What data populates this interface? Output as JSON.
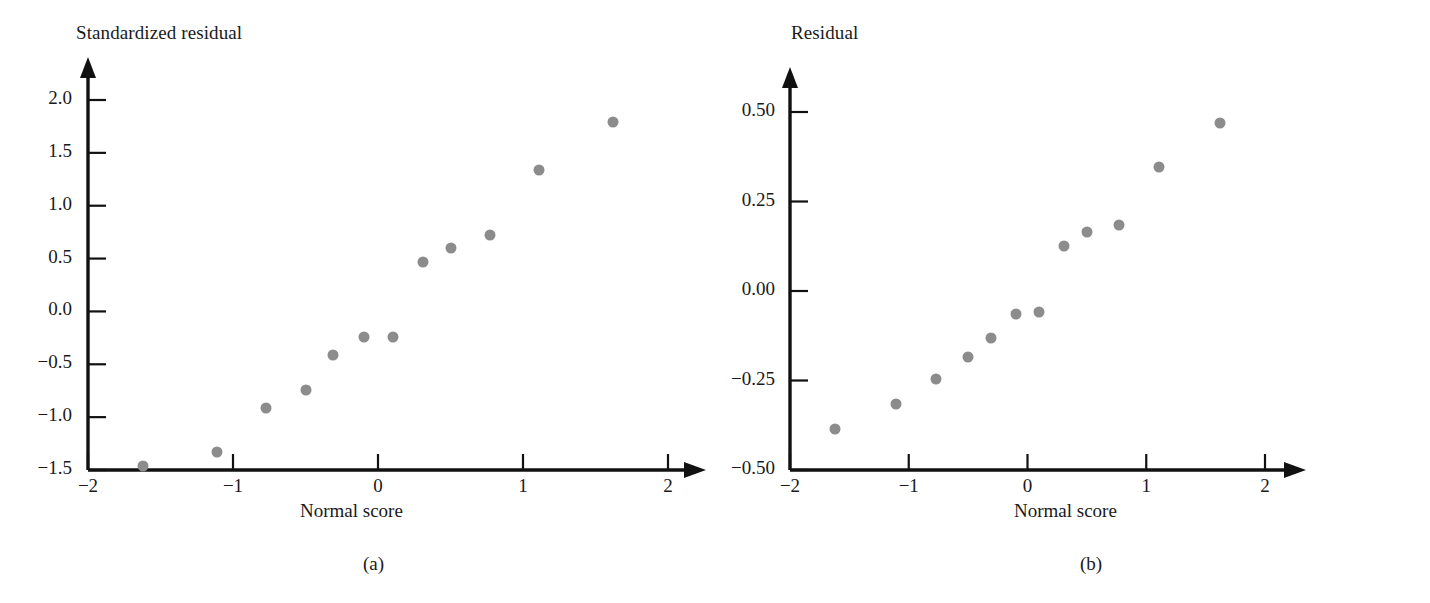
{
  "figure": {
    "caption_a": "(a)",
    "caption_b": "(b)"
  },
  "colors": {
    "point": "#8c8c8c",
    "axis": "#111111",
    "text": "#1a1a1a",
    "background": "#ffffff"
  },
  "chart_data": [
    {
      "id": "panel-a",
      "type": "scatter",
      "title": "",
      "panel_label": "(a)",
      "xlabel": "Normal score",
      "ylabel": "Standardized residual",
      "xlim": [
        -2,
        2
      ],
      "ylim": [
        -1.5,
        2.0
      ],
      "xticks": [
        -2,
        -1,
        0,
        1,
        2
      ],
      "xticklabels": [
        "−2",
        "−1",
        "0",
        "1",
        "2"
      ],
      "yticks": [
        -1.5,
        -1.0,
        -0.5,
        0.0,
        0.5,
        1.0,
        1.5,
        2.0
      ],
      "yticklabels": [
        "−1.5",
        "−1.0",
        "−0.5",
        "0.0",
        "0.5",
        "1.0",
        "1.5",
        "2.0"
      ],
      "grid": false,
      "legend": false,
      "axis_style": "arrow-ended L-axes",
      "x": [
        -1.62,
        -1.11,
        -0.77,
        -0.5,
        -0.31,
        -0.1,
        0.1,
        0.31,
        0.5,
        0.77,
        1.11,
        1.62
      ],
      "y": [
        -1.46,
        -1.33,
        -0.91,
        -0.74,
        -0.41,
        -0.24,
        -0.24,
        0.47,
        0.6,
        0.72,
        1.34,
        1.79
      ]
    },
    {
      "id": "panel-b",
      "type": "scatter",
      "title": "",
      "panel_label": "(b)",
      "xlabel": "Normal score",
      "ylabel": "Residual",
      "xlim": [
        -2,
        2
      ],
      "ylim": [
        -0.5,
        0.5
      ],
      "xticks": [
        -2,
        -1,
        0,
        1,
        2
      ],
      "xticklabels": [
        "−2",
        "−1",
        "0",
        "1",
        "2"
      ],
      "yticks": [
        -0.5,
        -0.25,
        0.0,
        0.25,
        0.5
      ],
      "yticklabels": [
        "−0.50",
        "−0.25",
        "0.00",
        "0.25",
        "0.50"
      ],
      "grid": false,
      "legend": false,
      "axis_style": "arrow-ended L-axes",
      "x": [
        -1.62,
        -1.11,
        -0.77,
        -0.5,
        -0.31,
        -0.1,
        0.1,
        0.31,
        0.5,
        0.77,
        1.11,
        1.62
      ],
      "y": [
        -0.385,
        -0.315,
        -0.245,
        -0.185,
        -0.13,
        -0.065,
        -0.06,
        0.125,
        0.165,
        0.185,
        0.345,
        0.47
      ]
    }
  ]
}
